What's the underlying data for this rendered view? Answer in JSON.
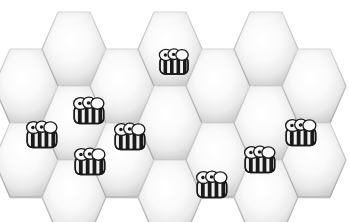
{
  "scene": {
    "title": "Honeycomb with bees",
    "width": 350,
    "height": 222,
    "background_color": "#ffffff"
  },
  "honeycomb": {
    "orientation": "flat-top",
    "cell_width": 64,
    "cell_height": 74,
    "column_step": 48,
    "row_step": 74,
    "odd_column_offset": 37,
    "border_color": "#b0b0b0",
    "border_width": 1.2,
    "fill_center_color": "#ffffff",
    "fill_edge_color": "#c9c9c9",
    "shadow_color": "#9e9e9e",
    "cells": [
      {
        "id": "c0r0",
        "col": 0,
        "row": 0,
        "cx": 26,
        "cy": 86,
        "has_bee": false
      },
      {
        "id": "c0r1",
        "col": 0,
        "row": 1,
        "cx": 26,
        "cy": 160,
        "has_bee": false
      },
      {
        "id": "c1r0",
        "col": 1,
        "row": 0,
        "cx": 74,
        "cy": 49,
        "has_bee": false
      },
      {
        "id": "c1r1",
        "col": 1,
        "row": 1,
        "cx": 74,
        "cy": 123,
        "has_bee": true
      },
      {
        "id": "c1r2",
        "col": 1,
        "row": 2,
        "cx": 74,
        "cy": 197,
        "has_bee": false
      },
      {
        "id": "c2r0",
        "col": 2,
        "row": 0,
        "cx": 122,
        "cy": 86,
        "has_bee": false
      },
      {
        "id": "c2r1",
        "col": 2,
        "row": 1,
        "cx": 122,
        "cy": 160,
        "has_bee": false
      },
      {
        "id": "c3r0",
        "col": 3,
        "row": 0,
        "cx": 170,
        "cy": 49,
        "has_bee": false
      },
      {
        "id": "c3r1",
        "col": 3,
        "row": 1,
        "cx": 170,
        "cy": 123,
        "has_bee": false
      },
      {
        "id": "c3r2",
        "col": 3,
        "row": 2,
        "cx": 170,
        "cy": 197,
        "has_bee": false
      },
      {
        "id": "c4r0",
        "col": 4,
        "row": 0,
        "cx": 218,
        "cy": 86,
        "has_bee": false
      },
      {
        "id": "c4r1",
        "col": 4,
        "row": 1,
        "cx": 218,
        "cy": 160,
        "has_bee": false
      },
      {
        "id": "c5r0",
        "col": 5,
        "row": 0,
        "cx": 266,
        "cy": 49,
        "has_bee": false
      },
      {
        "id": "c5r1",
        "col": 5,
        "row": 1,
        "cx": 266,
        "cy": 123,
        "has_bee": false
      },
      {
        "id": "c5r2",
        "col": 5,
        "row": 2,
        "cx": 266,
        "cy": 197,
        "has_bee": false
      },
      {
        "id": "c6r0",
        "col": 6,
        "row": 0,
        "cx": 314,
        "cy": 86,
        "has_bee": false
      },
      {
        "id": "c6r1",
        "col": 6,
        "row": 1,
        "cx": 314,
        "cy": 160,
        "has_bee": false
      }
    ]
  },
  "bees": {
    "count": 9,
    "body_stripe_dark": "#1a1a1a",
    "body_stripe_light": "#f2f2f2",
    "wing_color": "#fbfbfb",
    "outline_color": "#1a1a1a",
    "eye_color": "#ffffff",
    "pupil_color": "#1a1a1a",
    "items": [
      {
        "id": "bee-1",
        "label": "bee-top-center",
        "x": 155,
        "y": 44,
        "facing": "right",
        "scale": 1.0
      },
      {
        "id": "bee-2",
        "label": "bee-upper-left",
        "x": 69,
        "y": 92,
        "facing": "back",
        "scale": 1.05
      },
      {
        "id": "bee-3",
        "label": "bee-left-edge",
        "x": 22,
        "y": 116,
        "facing": "right",
        "scale": 1.05
      },
      {
        "id": "bee-4",
        "label": "bee-mid-left",
        "x": 110,
        "y": 118,
        "facing": "right",
        "scale": 1.05
      },
      {
        "id": "bee-5",
        "label": "bee-left-lower",
        "x": 70,
        "y": 143,
        "facing": "right",
        "scale": 1.05
      },
      {
        "id": "bee-6",
        "label": "bee-right-edge",
        "x": 281,
        "y": 114,
        "facing": "left",
        "scale": 1.05
      },
      {
        "id": "bee-7",
        "label": "bee-mid-right",
        "x": 240,
        "y": 141,
        "facing": "back",
        "scale": 1.05
      },
      {
        "id": "bee-8",
        "label": "bee-bottom-center",
        "x": 192,
        "y": 166,
        "facing": "left",
        "scale": 1.05
      }
    ]
  }
}
